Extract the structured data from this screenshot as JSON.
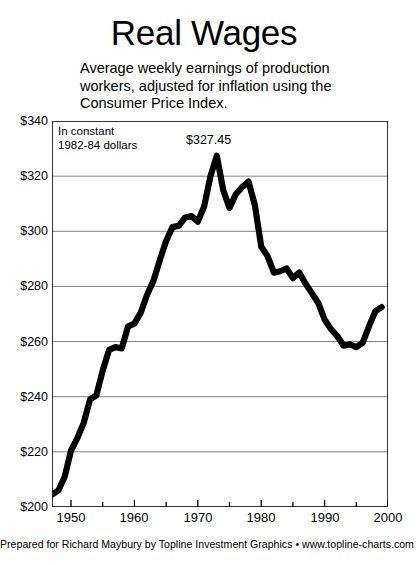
{
  "header": {
    "title": "Real Wages",
    "subtitle_lines": [
      "Average weekly earnings of production",
      "workers, adjusted for inflation using the",
      "Consumer Price Index."
    ]
  },
  "annotations": {
    "note_lines": [
      "In constant",
      "1982-84 dollars"
    ],
    "peak_label": "$327.45"
  },
  "footer": {
    "credit": "Prepared for Richard Maybury by Topline Investment Graphics • www.topline-charts.com"
  },
  "axis": {
    "y_ticks": [
      "$340",
      "$320",
      "$300",
      "$280",
      "$260",
      "$240",
      "$220",
      "$200"
    ],
    "x_ticks": [
      "1950",
      "1960",
      "1970",
      "1980",
      "1990",
      "2000"
    ]
  },
  "style": {
    "line_color": "#000000",
    "grid_color": "#808080",
    "frame_color": "#000000",
    "background": "#ffffff"
  },
  "chart_data": {
    "type": "line",
    "title": "Real Wages",
    "subtitle": "Average weekly earnings of production workers, adjusted for inflation using the Consumer Price Index.",
    "xlabel": "",
    "ylabel": "",
    "units": "Constant 1982-84 dollars per week",
    "xlim": [
      1947,
      2000
    ],
    "ylim": [
      200,
      340
    ],
    "y_tick_values": [
      200,
      220,
      240,
      260,
      280,
      300,
      320,
      340
    ],
    "x_tick_values": [
      1950,
      1960,
      1970,
      1980,
      1990,
      2000
    ],
    "x_minor_tick_values": [
      1955,
      1965,
      1975,
      1985,
      1995
    ],
    "grid": true,
    "grid_axis": "y",
    "legend": false,
    "peak": {
      "x": 1973,
      "y": 327.45,
      "label": "$327.45"
    },
    "series": [
      {
        "name": "Real average weekly earnings",
        "x": [
          1947,
          1948,
          1949,
          1950,
          1951,
          1952,
          1953,
          1954,
          1955,
          1956,
          1957,
          1958,
          1959,
          1960,
          1961,
          1962,
          1963,
          1964,
          1965,
          1966,
          1967,
          1968,
          1969,
          1970,
          1971,
          1972,
          1973,
          1974,
          1975,
          1976,
          1977,
          1978,
          1979,
          1980,
          1981,
          1982,
          1983,
          1984,
          1985,
          1986,
          1987,
          1988,
          1989,
          1990,
          1991,
          1992,
          1993,
          1994,
          1995,
          1996,
          1997,
          1998,
          1999
        ],
        "values": [
          204.5,
          206.0,
          211.0,
          220.5,
          225.0,
          230.5,
          239.0,
          240.5,
          249.5,
          257.0,
          258.0,
          257.5,
          265.5,
          266.5,
          270.5,
          277.0,
          282.0,
          289.5,
          296.5,
          301.5,
          302.0,
          305.0,
          305.5,
          303.5,
          309.0,
          320.0,
          327.45,
          315.0,
          308.5,
          313.5,
          316.0,
          318.0,
          309.5,
          294.5,
          291.0,
          285.0,
          285.5,
          286.5,
          283.0,
          285.0,
          281.0,
          277.5,
          274.0,
          268.0,
          264.5,
          262.0,
          258.5,
          259.0,
          258.0,
          259.5,
          265.5,
          271.0,
          272.5
        ]
      }
    ]
  }
}
